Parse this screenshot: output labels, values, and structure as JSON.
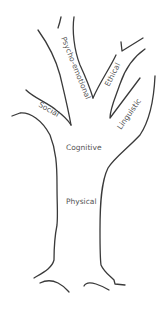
{
  "diagram": {
    "type": "tree",
    "colors": {
      "line": "#3a3a3a",
      "text": "#555555",
      "background": "#ffffff"
    },
    "labels": {
      "psycho_emotional": "Psycho-emotional",
      "ethical": "Ethical",
      "social": "Social",
      "linguistic": "Linguistic",
      "cognitive": "Cognitive",
      "physical": "Physical"
    }
  }
}
